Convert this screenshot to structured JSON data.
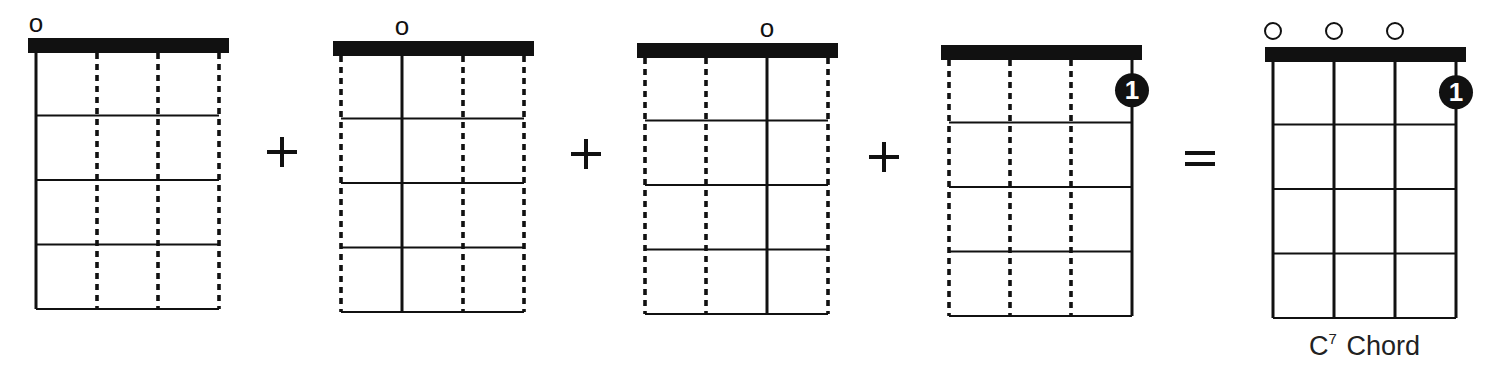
{
  "colors": {
    "ink": "#111111",
    "background": "#ffffff",
    "label": "#222222"
  },
  "diagrams": [
    {
      "id": "d1",
      "x": 28,
      "y": 38,
      "highlight_string": 0,
      "open_marker": {
        "string": 0,
        "glyph": "o",
        "style": "letter"
      },
      "finger_dot": null
    },
    {
      "id": "d2",
      "x": 333,
      "y": 41,
      "highlight_string": 1,
      "open_marker": {
        "string": 1,
        "glyph": "o",
        "style": "letter"
      },
      "finger_dot": null
    },
    {
      "id": "d3",
      "x": 637,
      "y": 43,
      "highlight_string": 2,
      "open_marker": {
        "string": 2,
        "glyph": "o",
        "style": "letter"
      },
      "finger_dot": null
    },
    {
      "id": "d4",
      "x": 941,
      "y": 45,
      "highlight_string": 3,
      "open_marker": null,
      "finger_dot": {
        "string": 3,
        "fret": 1,
        "label": "1"
      }
    },
    {
      "id": "d5",
      "x": 1265,
      "y": 47,
      "highlight_string": "all",
      "open_markers": [
        {
          "string": 0,
          "style": "circle"
        },
        {
          "string": 1,
          "style": "circle"
        },
        {
          "string": 2,
          "style": "circle"
        }
      ],
      "finger_dot": {
        "string": 3,
        "fret": 1,
        "label": "1"
      },
      "caption": {
        "root": "C",
        "superscript": "7",
        "suffix": "Chord"
      }
    }
  ],
  "operators": [
    {
      "symbol": "+",
      "x": 282,
      "y": 152
    },
    {
      "symbol": "+",
      "x": 586,
      "y": 154
    },
    {
      "symbol": "+",
      "x": 884,
      "y": 157
    },
    {
      "symbol": "=",
      "x": 1200,
      "y": 158
    }
  ],
  "geometry": {
    "nut_width": 201,
    "nut_height": 15,
    "string_offsets": [
      8,
      69,
      130,
      191
    ],
    "fret_spacing": 64.5,
    "fret_count": 4
  }
}
